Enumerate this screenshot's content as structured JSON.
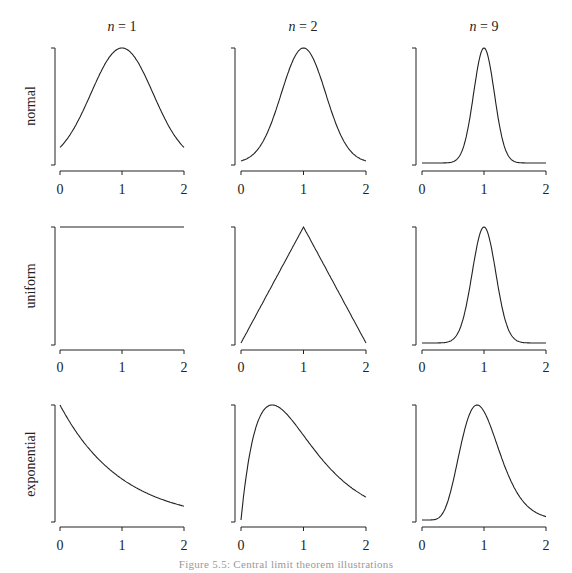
{
  "figure": {
    "caption": "Figure 5.5: Central limit theorem illustrations",
    "caption_note": "caption partially cut off at bottom edge; wording estimated",
    "line_color": "#222222",
    "background": "#ffffff"
  },
  "columns": [
    {
      "label_var": "n",
      "label_eq": " = ",
      "label_val": "1"
    },
    {
      "label_var": "n",
      "label_eq": " = ",
      "label_val": "2"
    },
    {
      "label_var": "n",
      "label_eq": " = ",
      "label_val": "9"
    }
  ],
  "rows": [
    {
      "label": "normal"
    },
    {
      "label": "uniform"
    },
    {
      "label": "exponential"
    }
  ],
  "x_ticks": [
    "0",
    "1",
    "2"
  ],
  "chart_data": {
    "type": "line",
    "title": "",
    "layout": "3x3 grid of density plots (rows: source distribution; columns: number of summands n)",
    "xlabel": "",
    "ylabel": "",
    "xlim": [
      0,
      2
    ],
    "x_ticks": [
      0,
      1,
      2
    ],
    "y_ticks": [],
    "grid": false,
    "legend": null,
    "panels": [
      {
        "row": "normal",
        "col": "n = 1",
        "shape": "bell curve peaked at x=1, tails at ~0.15 of max at x=0 and x=2",
        "x": [
          0,
          0.25,
          0.5,
          0.75,
          1,
          1.25,
          1.5,
          1.75,
          2
        ],
        "y_rel": [
          0.14,
          0.32,
          0.61,
          0.88,
          1.0,
          0.88,
          0.61,
          0.32,
          0.14
        ]
      },
      {
        "row": "normal",
        "col": "n = 2",
        "shape": "narrower bell peaked at x=1, tails near 0",
        "x": [
          0,
          0.25,
          0.5,
          0.75,
          1,
          1.25,
          1.5,
          1.75,
          2
        ],
        "y_rel": [
          0.02,
          0.11,
          0.37,
          0.78,
          1.0,
          0.78,
          0.37,
          0.11,
          0.02
        ]
      },
      {
        "row": "normal",
        "col": "n = 9",
        "shape": "sharp narrow bell peaked at x=1",
        "x": [
          0,
          0.5,
          0.7,
          0.85,
          1,
          1.15,
          1.3,
          1.5,
          2
        ],
        "y_rel": [
          0.0,
          0.01,
          0.13,
          0.61,
          1.0,
          0.61,
          0.13,
          0.01,
          0.0
        ]
      },
      {
        "row": "uniform",
        "col": "n = 1",
        "shape": "flat horizontal line at max from x=0 to x=2",
        "x": [
          0,
          2
        ],
        "y_rel": [
          1.0,
          1.0
        ]
      },
      {
        "row": "uniform",
        "col": "n = 2",
        "shape": "triangle from 0 at x=0 to peak at x=1 down to 0 at x=2",
        "x": [
          0,
          1,
          2
        ],
        "y_rel": [
          0.0,
          1.0,
          0.0
        ]
      },
      {
        "row": "uniform",
        "col": "n = 9",
        "shape": "narrow bell peaked at x=1",
        "x": [
          0,
          0.5,
          0.7,
          0.85,
          1,
          1.15,
          1.3,
          1.5,
          2
        ],
        "y_rel": [
          0.0,
          0.02,
          0.2,
          0.68,
          1.0,
          0.68,
          0.2,
          0.02,
          0.0
        ]
      },
      {
        "row": "exponential",
        "col": "n = 1",
        "shape": "decaying exponential from max at x=0",
        "x": [
          0,
          0.5,
          1,
          1.5,
          2
        ],
        "y_rel": [
          1.0,
          0.61,
          0.37,
          0.22,
          0.14
        ]
      },
      {
        "row": "exponential",
        "col": "n = 2",
        "shape": "right-skewed gamma(2) peaked at x=0.5, starting at 0",
        "x": [
          0,
          0.1,
          0.25,
          0.5,
          0.75,
          1,
          1.5,
          2
        ],
        "y_rel": [
          0.0,
          0.45,
          0.82,
          1.0,
          0.91,
          0.74,
          0.41,
          0.2
        ]
      },
      {
        "row": "exponential",
        "col": "n = 9",
        "shape": "mildly right-skewed bell peaked near x=0.89",
        "x": [
          0,
          0.25,
          0.5,
          0.75,
          0.89,
          1,
          1.25,
          1.5,
          1.75,
          2
        ],
        "y_rel": [
          0.0,
          0.03,
          0.36,
          0.87,
          1.0,
          0.95,
          0.6,
          0.26,
          0.09,
          0.03
        ]
      }
    ]
  }
}
